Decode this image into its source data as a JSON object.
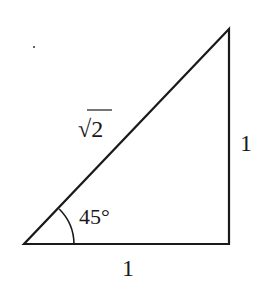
{
  "diagram": {
    "type": "right-triangle",
    "vertices": {
      "bottom_left": [
        24,
        244
      ],
      "bottom_right": [
        229,
        244
      ],
      "top_right": [
        229,
        29
      ]
    },
    "labels": {
      "hypotenuse": "√2",
      "vertical_side": "1",
      "horizontal_side": "1",
      "angle": "45°"
    },
    "colors": {
      "stroke": "#1a1a1a",
      "background": "#ffffff"
    }
  }
}
